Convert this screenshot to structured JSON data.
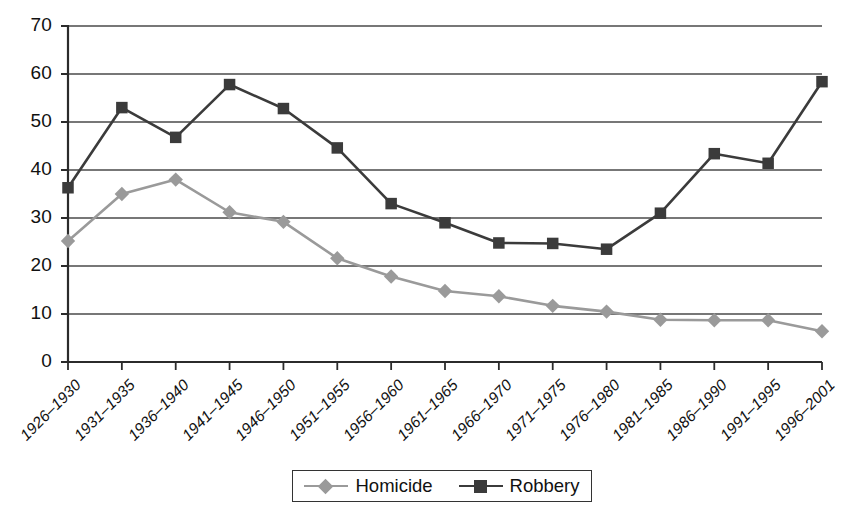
{
  "chart_data": {
    "type": "line",
    "title": "",
    "xlabel": "",
    "ylabel": "",
    "ylim": [
      0,
      70
    ],
    "ytick_step": 10,
    "grid": true,
    "legend_position": "bottom",
    "categories": [
      "1926–1930",
      "1931–1935",
      "1936–1940",
      "1941–1945",
      "1946–1950",
      "1951–1955",
      "1956–1960",
      "1961–1965",
      "1966–1970",
      "1971–1975",
      "1976–1980",
      "1981–1985",
      "1986–1990",
      "1991–1995",
      "1996–2001"
    ],
    "yticks": [
      "0",
      "10",
      "20",
      "30",
      "40",
      "50",
      "60",
      "70"
    ],
    "series": [
      {
        "name": "Homicide",
        "color": "#9a9a9a",
        "marker": "diamond",
        "values": [
          25.2,
          35.0,
          38.0,
          31.2,
          29.2,
          21.6,
          17.8,
          14.8,
          13.7,
          11.7,
          10.5,
          8.8,
          8.7,
          8.7,
          6.4
        ]
      },
      {
        "name": "Robbery",
        "color": "#3b3b3b",
        "marker": "square",
        "values": [
          36.3,
          53.0,
          46.8,
          57.8,
          52.8,
          44.6,
          33.0,
          29.0,
          24.8,
          24.7,
          23.5,
          31.0,
          43.4,
          41.4,
          58.4
        ]
      }
    ]
  },
  "legend": {
    "items": [
      {
        "label": "Homicide",
        "color": "#9a9a9a",
        "marker": "diamond"
      },
      {
        "label": "Robbery",
        "color": "#3b3b3b",
        "marker": "square"
      }
    ]
  },
  "colors": {
    "homicide": "#9a9a9a",
    "robbery": "#3b3b3b",
    "axis": "#2b2b2b",
    "grid": "#4a4a4a",
    "background": "#ffffff"
  }
}
